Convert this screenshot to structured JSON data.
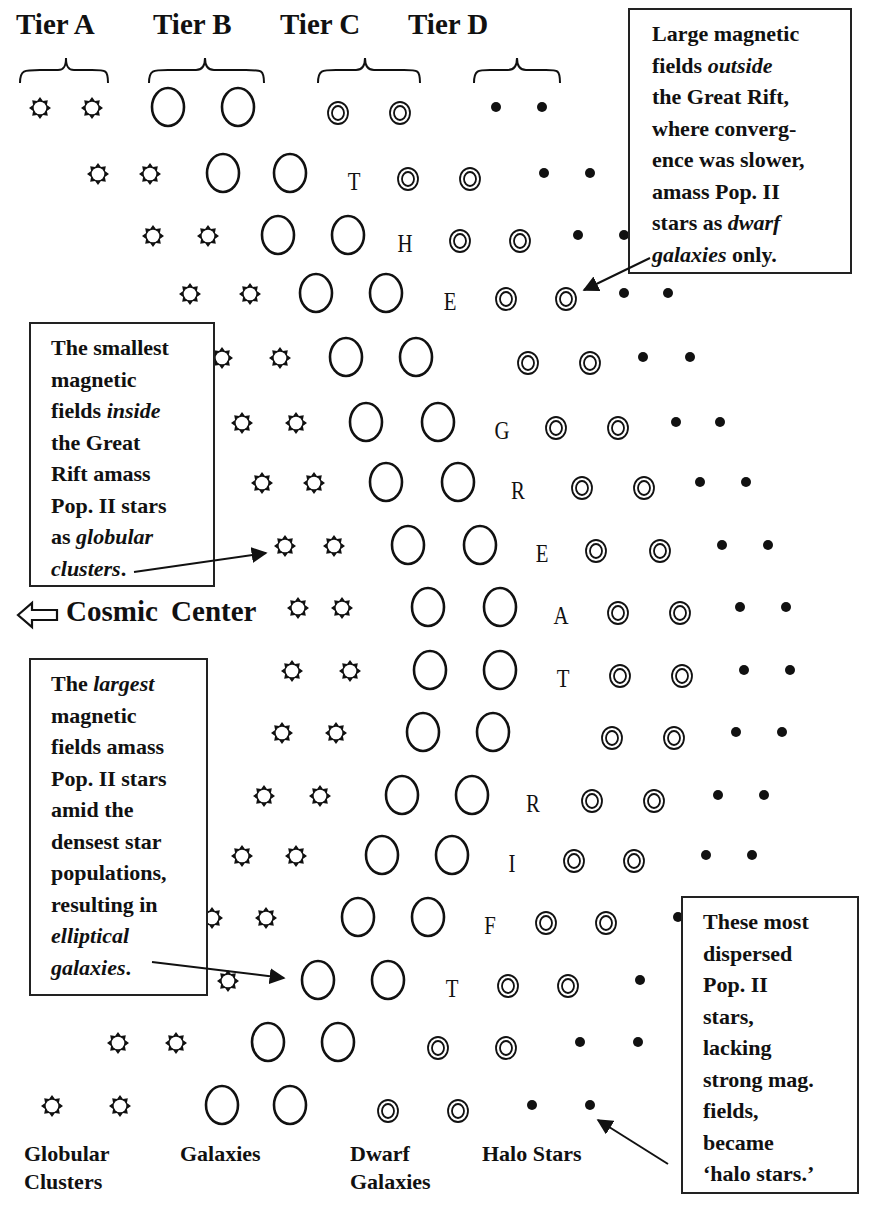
{
  "tiers": [
    {
      "label": "Tier A",
      "x": 16
    },
    {
      "label": "Tier B",
      "x": 153
    },
    {
      "label": "Tier C",
      "x": 280
    },
    {
      "label": "Tier D",
      "x": 408
    }
  ],
  "symbols": {
    "tier_a": "globular-cluster-star",
    "tier_b": "galaxy-ellipse",
    "tier_c": "dwarf-galaxy-double-ring",
    "tier_d": "halo-star-dot"
  },
  "vertical_text": "THE GREAT RIFT",
  "rows": [
    {
      "y": 112,
      "a": [
        40,
        92
      ],
      "b": [
        168,
        238
      ],
      "letter": "",
      "lx": 0,
      "c": [
        338,
        400
      ],
      "d": [
        496,
        542
      ]
    },
    {
      "y": 178,
      "a": [
        98,
        150
      ],
      "b": [
        223,
        290
      ],
      "letter": "T",
      "lx": 354,
      "c": [
        408,
        470
      ],
      "d": [
        544,
        590
      ]
    },
    {
      "y": 240,
      "a": [
        153,
        208
      ],
      "b": [
        278,
        348
      ],
      "letter": "H",
      "lx": 405,
      "c": [
        460,
        520
      ],
      "d": [
        578,
        624
      ]
    },
    {
      "y": 298,
      "a": [
        190,
        250
      ],
      "b": [
        316,
        386
      ],
      "letter": "E",
      "lx": 450,
      "c": [
        506,
        566
      ],
      "d": [
        624,
        668
      ]
    },
    {
      "y": 362,
      "a": [
        222,
        280
      ],
      "b": [
        346,
        416
      ],
      "letter": "",
      "lx": 0,
      "c": [
        528,
        590
      ],
      "d": [
        643,
        690
      ]
    },
    {
      "y": 427,
      "a": [
        242,
        296
      ],
      "b": [
        366,
        438
      ],
      "letter": "G",
      "lx": 502,
      "c": [
        556,
        618
      ],
      "d": [
        676,
        720
      ]
    },
    {
      "y": 487,
      "a": [
        262,
        314
      ],
      "b": [
        386,
        458
      ],
      "letter": "R",
      "lx": 518,
      "c": [
        582,
        644
      ],
      "d": [
        700,
        746
      ]
    },
    {
      "y": 550,
      "a": [
        285,
        334
      ],
      "b": [
        408,
        480
      ],
      "letter": "E",
      "lx": 542,
      "c": [
        596,
        660
      ],
      "d": [
        722,
        768
      ]
    },
    {
      "y": 612,
      "a": [
        298,
        342
      ],
      "b": [
        428,
        500
      ],
      "letter": "A",
      "lx": 561,
      "c": [
        618,
        680
      ],
      "d": [
        740,
        786
      ]
    },
    {
      "y": 675,
      "a": [
        292,
        350
      ],
      "b": [
        430,
        500
      ],
      "letter": "T",
      "lx": 563,
      "c": [
        620,
        682
      ],
      "d": [
        744,
        790
      ]
    },
    {
      "y": 737,
      "a": [
        282,
        336
      ],
      "b": [
        423,
        493
      ],
      "letter": "",
      "lx": 0,
      "c": [
        612,
        674
      ],
      "d": [
        736,
        782
      ]
    },
    {
      "y": 800,
      "a": [
        264,
        320
      ],
      "b": [
        402,
        472
      ],
      "letter": "R",
      "lx": 533,
      "c": [
        592,
        654
      ],
      "d": [
        718,
        764
      ]
    },
    {
      "y": 860,
      "a": [
        242,
        296
      ],
      "b": [
        382,
        452
      ],
      "letter": "I",
      "lx": 512,
      "c": [
        574,
        634
      ],
      "d": [
        706,
        752
      ]
    },
    {
      "y": 922,
      "a": [
        212,
        266
      ],
      "b": [
        358,
        428
      ],
      "letter": "F",
      "lx": 490,
      "c": [
        546,
        606
      ],
      "d": [
        678,
        0
      ]
    },
    {
      "y": 985,
      "a": [
        168,
        228
      ],
      "b": [
        318,
        388
      ],
      "letter": "T",
      "lx": 452,
      "c": [
        508,
        568
      ],
      "d": [
        640,
        0
      ]
    },
    {
      "y": 1047,
      "a": [
        118,
        176
      ],
      "b": [
        268,
        338
      ],
      "letter": "",
      "lx": 0,
      "c": [
        438,
        506
      ],
      "d": [
        580,
        638
      ]
    },
    {
      "y": 1110,
      "a": [
        52,
        120
      ],
      "b": [
        222,
        290
      ],
      "letter": "",
      "lx": 0,
      "c": [
        388,
        458
      ],
      "d": [
        532,
        590
      ]
    }
  ],
  "cosmic_center": {
    "label": "Cosmic  Center",
    "arrow": "hollow-left-arrow"
  },
  "boxes": {
    "dwarf": {
      "lines": [
        "Large magnetic",
        "fields <i>outside</i>",
        "the Great Rift,",
        "where converg-",
        "ence was slower,",
        "amass Pop. II",
        "stars as <i>dwarf</i>",
        "<i>galaxies</i> only."
      ]
    },
    "globular": {
      "lines": [
        "The smallest",
        "magnetic",
        "fields <i>inside</i>",
        "the Great",
        "Rift amass",
        "Pop. II stars",
        "as <i>globular</i>",
        "<i>clusters</i>."
      ]
    },
    "elliptical": {
      "lines": [
        "The <i>largest</i>",
        "magnetic",
        "fields amass",
        "Pop. II stars",
        "amid the",
        "densest star",
        "populations,",
        "resulting in",
        "<i>elliptical</i>",
        "<i>galaxies</i>."
      ]
    },
    "halo": {
      "lines": [
        "These most",
        "dispersed",
        "Pop. II",
        "stars,",
        "lacking",
        "strong mag.",
        "fields,",
        "became",
        "‘halo stars.’"
      ]
    }
  },
  "bottom_labels": {
    "globular": {
      "line1": "Globular",
      "line2": "Clusters"
    },
    "galaxies": {
      "line1": "Galaxies"
    },
    "dwarf": {
      "line1": "Dwarf",
      "line2": "Galaxies"
    },
    "halo": {
      "line1": "Halo Stars"
    }
  },
  "colors": {
    "ink": "#111111",
    "background": "#ffffff"
  }
}
